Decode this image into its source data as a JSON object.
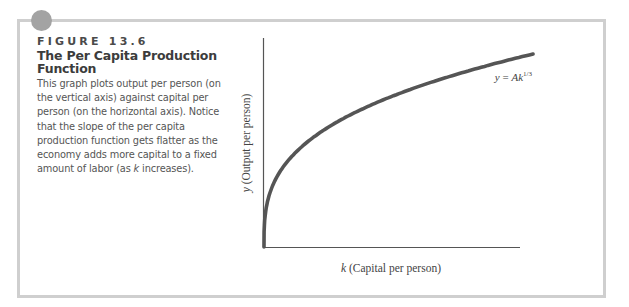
{
  "figure": {
    "label": "FIGURE 13.6",
    "title_line1": "The Per Capita Production",
    "title_line2": "Function",
    "body_part1": "This graph plots output per person (on the vertical axis) against capital per person (on the horizontal axis). Notice that the slope of the per capita production function gets flatter as the economy adds more capital to a fixed amount of labor (as ",
    "body_k": "k",
    "body_part2": " increases).",
    "accent_color": "#a3a3a3",
    "border_color": "#cfcfcf"
  },
  "chart_data": {
    "type": "line",
    "title": "The Per Capita Production Function",
    "xlabel_var": "k",
    "xlabel": "(Capital per person)",
    "ylabel_var": "y",
    "ylabel": "(Output per person)",
    "annotation": {
      "lhs": "y = Ak",
      "exponent": "1/3"
    },
    "series": [
      {
        "name": "y = Ak^(1/3)",
        "function": "y = A * k^(1/3)",
        "x": [
          0,
          0.05,
          0.1,
          0.2,
          0.3,
          0.4,
          0.5,
          0.6,
          0.7,
          0.8,
          0.9,
          1.0
        ],
        "values": [
          0,
          0.368,
          0.464,
          0.585,
          0.669,
          0.737,
          0.794,
          0.843,
          0.888,
          0.928,
          0.965,
          1.0
        ],
        "color": "#555555"
      }
    ],
    "tick_labels": "none",
    "grid": false,
    "legend": "none"
  }
}
